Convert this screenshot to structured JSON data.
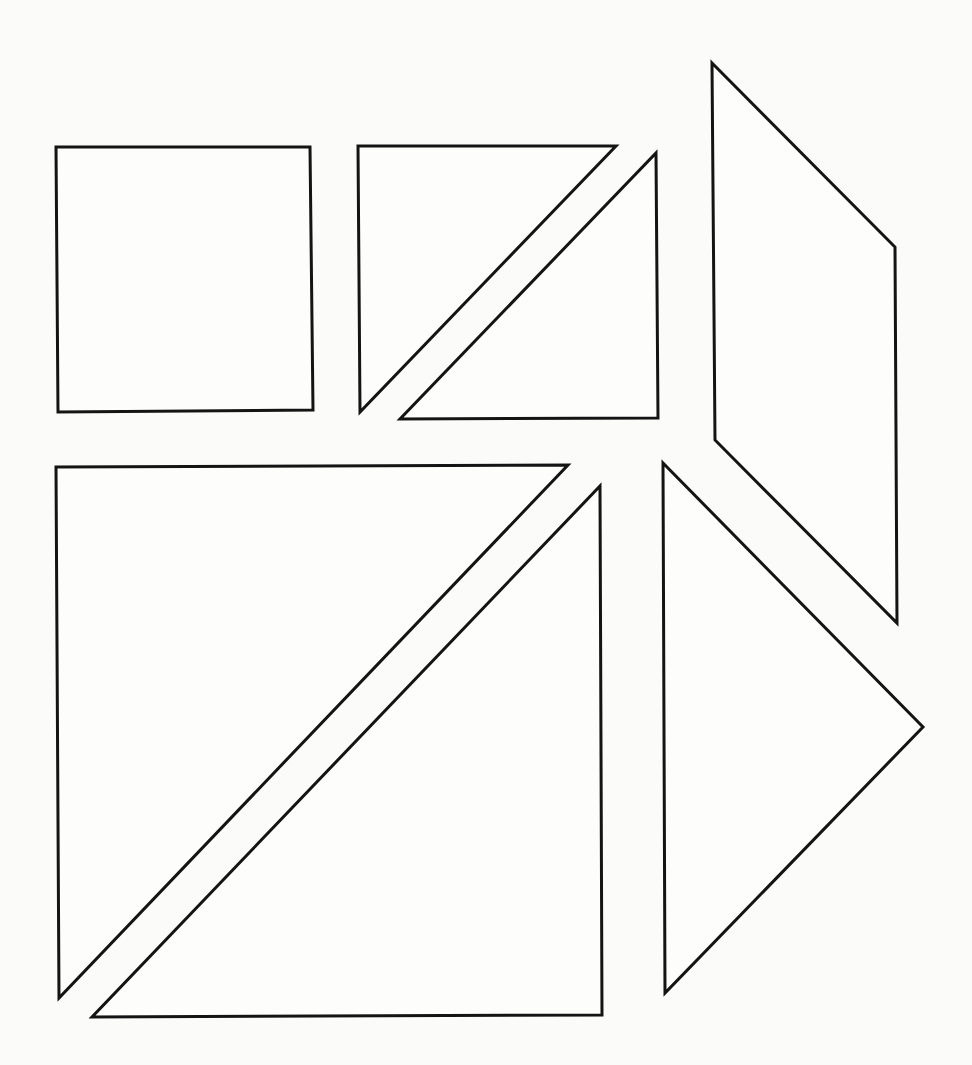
{
  "diagram": {
    "type": "tangram-pieces",
    "width": 972,
    "height": 1065,
    "colors": {
      "background": "#fbfbfa",
      "fill": "#fdfdfc",
      "stroke": "#141414"
    },
    "stroke_width": 3,
    "pieces": [
      {
        "id": "square",
        "kind": "square",
        "points": "56,147 310,147 313,410 58,412"
      },
      {
        "id": "small-triangle-1",
        "kind": "small-triangle",
        "points": "358,146 616,146 360,412"
      },
      {
        "id": "small-triangle-2",
        "kind": "small-triangle",
        "points": "656,153 658,418 400,419"
      },
      {
        "id": "parallelogram",
        "kind": "parallelogram",
        "points": "712,63 895,247 897,623 715,440"
      },
      {
        "id": "large-triangle-1",
        "kind": "large-triangle",
        "points": "56,467 568,465 59,998"
      },
      {
        "id": "large-triangle-2",
        "kind": "large-triangle",
        "points": "600,486 602,1015 92,1017"
      },
      {
        "id": "medium-triangle",
        "kind": "medium-triangle",
        "points": "663,463 923,727 665,993"
      }
    ]
  }
}
